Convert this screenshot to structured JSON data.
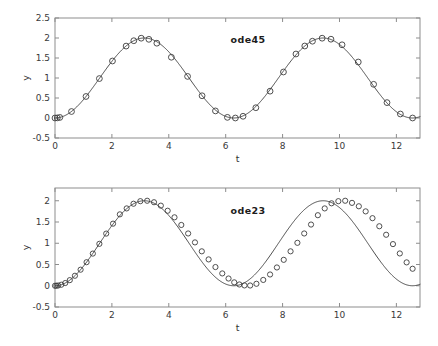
{
  "figure": {
    "background": "#ffffff",
    "axis_color": "#8d8d8d",
    "line_color": "#4a4a4a",
    "marker_color": "#3c3c3c"
  },
  "chart_data": [
    {
      "type": "line",
      "title": "",
      "annotation": "ode45",
      "xlabel": "t",
      "ylabel": "y",
      "xlim": [
        0,
        12.83
      ],
      "ylim": [
        -0.5,
        2.5
      ],
      "xticks": [
        0,
        2,
        4,
        6,
        8,
        10,
        12
      ],
      "xticklabels": [
        "0",
        "2",
        "4",
        "6",
        "8",
        "10",
        "12"
      ],
      "yticks": [
        -0.5,
        0,
        0.5,
        1,
        1.5,
        2,
        2.5
      ],
      "yticklabels": [
        "-0.5",
        "0",
        "0.5",
        "1",
        "1.5",
        "2",
        "2.5"
      ],
      "grid": false,
      "legend": "none",
      "marker": "circle",
      "series": [
        {
          "name": "ode45",
          "x": [
            0.0,
            0.08,
            0.17,
            0.58,
            1.09,
            1.56,
            2.02,
            2.5,
            2.77,
            3.03,
            3.3,
            3.58,
            4.09,
            4.66,
            5.17,
            5.64,
            6.06,
            6.34,
            6.61,
            7.06,
            7.56,
            8.03,
            8.47,
            8.78,
            9.05,
            9.39,
            9.7,
            10.09,
            10.66,
            11.2,
            11.67,
            12.14,
            12.57
          ],
          "y": [
            0.0,
            0.003,
            0.014,
            0.162,
            0.538,
            0.986,
            1.425,
            1.798,
            1.932,
            1.995,
            1.967,
            1.87,
            1.519,
            1.04,
            0.556,
            0.177,
            0.016,
            0.0,
            0.043,
            0.257,
            0.671,
            1.15,
            1.6,
            1.8,
            1.92,
            1.995,
            1.97,
            1.83,
            1.4,
            0.842,
            0.385,
            0.1,
            0.0
          ]
        }
      ]
    },
    {
      "type": "line",
      "title": "",
      "annotation": "ode23",
      "xlabel": "t",
      "ylabel": "y",
      "xlim": [
        0,
        12.83
      ],
      "ylim": [
        -0.5,
        2.3
      ],
      "xticks": [
        0,
        2,
        4,
        6,
        8,
        10,
        12
      ],
      "xticklabels": [
        "0",
        "2",
        "4",
        "6",
        "8",
        "10",
        "12"
      ],
      "yticks": [
        -0.5,
        0,
        0.5,
        1,
        1.5,
        2
      ],
      "yticklabels": [
        "-0.5",
        "0",
        "0.5",
        "1",
        "1.5",
        "2"
      ],
      "grid": false,
      "legend": "none",
      "marker": "circle",
      "series": [
        {
          "name": "ode23",
          "x": [
            0.0,
            0.05,
            0.11,
            0.22,
            0.36,
            0.52,
            0.7,
            0.9,
            1.11,
            1.33,
            1.56,
            1.8,
            2.04,
            2.28,
            2.52,
            2.76,
            3.0,
            3.24,
            3.48,
            3.72,
            3.96,
            4.2,
            4.44,
            4.68,
            4.92,
            5.16,
            5.4,
            5.64,
            5.88,
            6.1,
            6.3,
            6.48,
            6.66,
            6.86,
            7.08,
            7.32,
            7.56,
            7.8,
            8.04,
            8.28,
            8.52,
            8.76,
            9.0,
            9.24,
            9.48,
            9.72,
            9.96,
            10.2,
            10.44,
            10.68,
            10.92,
            11.16,
            11.4,
            11.64,
            11.88,
            12.12,
            12.36,
            12.57
          ],
          "y": [
            0.0,
            0.001,
            0.006,
            0.024,
            0.064,
            0.132,
            0.235,
            0.378,
            0.554,
            0.757,
            0.986,
            1.227,
            1.461,
            1.68,
            1.82,
            1.93,
            1.99,
            2.0,
            1.965,
            1.885,
            1.765,
            1.61,
            1.43,
            1.23,
            1.02,
            0.81,
            0.62,
            0.44,
            0.29,
            0.17,
            0.08,
            0.03,
            0.008,
            0.006,
            0.046,
            0.137,
            0.265,
            0.43,
            0.61,
            0.81,
            1.01,
            1.23,
            1.44,
            1.66,
            1.82,
            1.94,
            1.99,
            2.0,
            1.95,
            1.87,
            1.75,
            1.59,
            1.4,
            1.2,
            0.98,
            0.76,
            0.55,
            0.4
          ]
        }
      ]
    }
  ]
}
